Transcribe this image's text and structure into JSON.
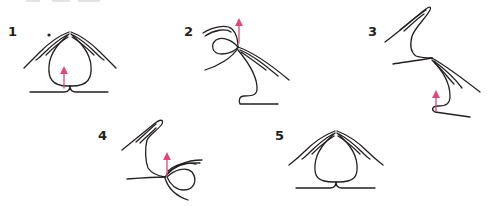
{
  "diagram": {
    "type": "step-sequence",
    "arrow_color": "#e0457b",
    "ink_color": "#231f20",
    "steps": [
      {
        "label": "1",
        "has_arrow": true,
        "arrow_direction": "up",
        "has_marker_dot": true
      },
      {
        "label": "2",
        "has_arrow": true,
        "arrow_direction": "up",
        "has_marker_dot": false
      },
      {
        "label": "3",
        "has_arrow": true,
        "arrow_direction": "up",
        "has_marker_dot": false
      },
      {
        "label": "4",
        "has_arrow": true,
        "arrow_direction": "up",
        "has_marker_dot": false
      },
      {
        "label": "5",
        "has_arrow": false,
        "has_marker_dot": false
      }
    ]
  }
}
